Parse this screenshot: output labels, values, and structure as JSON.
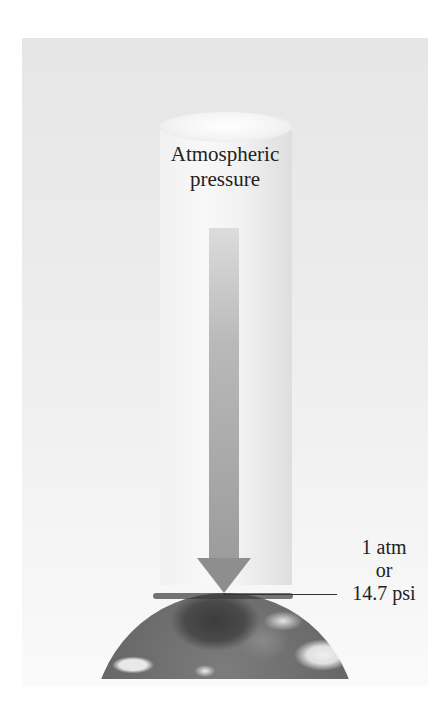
{
  "diagram": {
    "column_label": [
      "Atmospheric",
      "pressure"
    ],
    "value_label": [
      "1 atm",
      "or",
      "14.7 psi"
    ],
    "elements": [
      "air column",
      "downward arrow",
      "earth surface",
      "leader line"
    ]
  }
}
